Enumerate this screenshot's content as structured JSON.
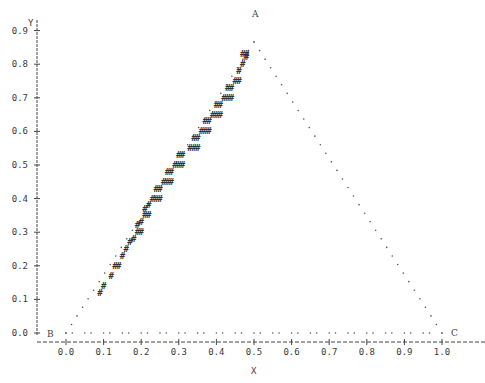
{
  "chart_data": {
    "type": "scatter",
    "title": "",
    "xlabel": "X",
    "ylabel": "Y",
    "xlim": [
      0.0,
      1.0
    ],
    "ylim": [
      0.0,
      0.9
    ],
    "grid": false,
    "legend": null,
    "x_ticks": [
      "0.0",
      "0.1",
      "0.2",
      "0.3",
      "0.4",
      "0.5",
      "0.6",
      "0.7",
      "0.8",
      "0.9",
      "1.0"
    ],
    "y_ticks": [
      "0.0",
      "0.1",
      "0.2",
      "0.3",
      "0.4",
      "0.5",
      "0.6",
      "0.7",
      "0.8",
      "0.9"
    ],
    "annotations": [
      {
        "label": "A",
        "x": 0.5,
        "y": 0.866
      },
      {
        "label": "B",
        "x": 0.0,
        "y": 0.0
      },
      {
        "label": "C",
        "x": 1.0,
        "y": 0.0
      }
    ],
    "series": [
      {
        "name": "triangle-edge-dots",
        "marker": ".",
        "description": "Dotted outline of equilateral triangle A-B-C",
        "edges": [
          {
            "from": [
              0.0,
              0.0
            ],
            "to": [
              0.5,
              0.866
            ]
          },
          {
            "from": [
              0.5,
              0.866
            ],
            "to": [
              1.0,
              0.0
            ]
          },
          {
            "from": [
              0.0,
              0.0
            ],
            "to": [
              1.0,
              0.0
            ]
          }
        ]
      },
      {
        "name": "hash-band",
        "marker": "#",
        "description": "Band of # marks along inner side of edge AB",
        "points": [
          [
            0.09,
            0.12
          ],
          [
            0.1,
            0.14
          ],
          [
            0.12,
            0.17
          ],
          [
            0.13,
            0.2
          ],
          [
            0.14,
            0.2
          ],
          [
            0.15,
            0.23
          ],
          [
            0.16,
            0.25
          ],
          [
            0.17,
            0.27
          ],
          [
            0.18,
            0.28
          ],
          [
            0.19,
            0.3
          ],
          [
            0.2,
            0.3
          ],
          [
            0.19,
            0.32
          ],
          [
            0.2,
            0.33
          ],
          [
            0.21,
            0.35
          ],
          [
            0.22,
            0.35
          ],
          [
            0.21,
            0.37
          ],
          [
            0.22,
            0.38
          ],
          [
            0.23,
            0.4
          ],
          [
            0.24,
            0.4
          ],
          [
            0.25,
            0.4
          ],
          [
            0.24,
            0.43
          ],
          [
            0.25,
            0.43
          ],
          [
            0.26,
            0.45
          ],
          [
            0.27,
            0.45
          ],
          [
            0.28,
            0.45
          ],
          [
            0.27,
            0.48
          ],
          [
            0.28,
            0.48
          ],
          [
            0.29,
            0.5
          ],
          [
            0.3,
            0.5
          ],
          [
            0.31,
            0.5
          ],
          [
            0.3,
            0.53
          ],
          [
            0.31,
            0.53
          ],
          [
            0.33,
            0.55
          ],
          [
            0.34,
            0.55
          ],
          [
            0.35,
            0.55
          ],
          [
            0.34,
            0.58
          ],
          [
            0.35,
            0.58
          ],
          [
            0.36,
            0.6
          ],
          [
            0.37,
            0.6
          ],
          [
            0.38,
            0.6
          ],
          [
            0.37,
            0.63
          ],
          [
            0.38,
            0.63
          ],
          [
            0.39,
            0.65
          ],
          [
            0.4,
            0.65
          ],
          [
            0.41,
            0.65
          ],
          [
            0.4,
            0.68
          ],
          [
            0.41,
            0.68
          ],
          [
            0.42,
            0.7
          ],
          [
            0.43,
            0.7
          ],
          [
            0.44,
            0.7
          ],
          [
            0.43,
            0.73
          ],
          [
            0.44,
            0.73
          ],
          [
            0.45,
            0.75
          ],
          [
            0.46,
            0.75
          ],
          [
            0.46,
            0.78
          ],
          [
            0.47,
            0.8
          ],
          [
            0.48,
            0.82
          ],
          [
            0.47,
            0.83
          ],
          [
            0.48,
            0.83
          ]
        ]
      }
    ]
  },
  "axes": {
    "x_label": "X",
    "y_label": "Y"
  }
}
